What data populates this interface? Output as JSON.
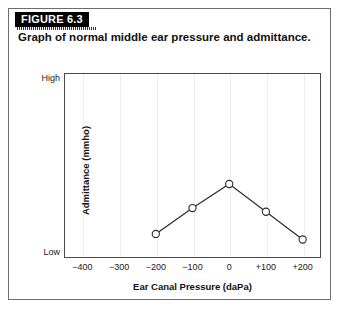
{
  "figure": {
    "banner_label": "FIGURE 6.3",
    "caption": "Graph of normal middle ear pressure and admittance.",
    "banner_bg": "#000000",
    "banner_text_color": "#ffffff",
    "frame_color": "#6e6e6e"
  },
  "chart_data": {
    "type": "line",
    "title": "Graph of normal middle ear pressure and admittance.",
    "xlabel": "Ear Canal Pressure (daPa)",
    "ylabel": "Admittance (mmho)",
    "x": [
      -200,
      -100,
      0,
      100,
      200
    ],
    "values": [
      0.13,
      0.27,
      0.4,
      0.25,
      0.1
    ],
    "series": [
      {
        "name": "Normal tympanogram",
        "x": [
          -200,
          -100,
          0,
          100,
          200
        ],
        "values": [
          0.13,
          0.27,
          0.4,
          0.25,
          0.1
        ]
      }
    ],
    "xlim": [
      -450,
      250
    ],
    "ylim": [
      0,
      1
    ],
    "xticks": [
      -400,
      -300,
      -200,
      -100,
      0,
      100,
      200
    ],
    "xtick_labels": [
      "−400",
      "−300",
      "−200",
      "−100",
      "0",
      "+100",
      "+200"
    ],
    "ytick_labels": [
      "High",
      "Low"
    ],
    "y_axis_top_label": "High",
    "y_axis_bottom_label": "Low",
    "grid": "vertical",
    "legend": "none",
    "marker": "open-circle",
    "line_color": "#2b2b2b",
    "marker_fill": "#ffffff",
    "marker_edge": "#2b2b2b",
    "gridline_color": "#ededed",
    "plot_border_color": "#4a4a4a"
  }
}
